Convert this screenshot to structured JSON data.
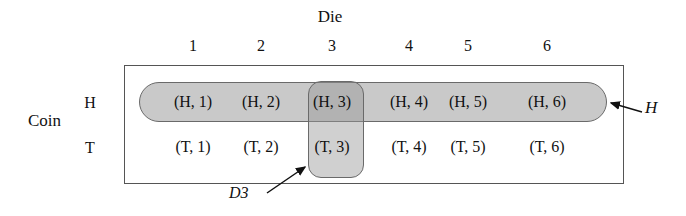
{
  "figure": {
    "title_top": "Die",
    "title_side": "Coin",
    "column_headers": [
      "1",
      "2",
      "3",
      "4",
      "5",
      "6"
    ],
    "row_headers": [
      "H",
      "T"
    ],
    "cells": {
      "row_h": [
        "(H, 1)",
        "(H, 2)",
        "(H, 3)",
        "(H, 4)",
        "(H, 5)",
        "(H, 6)"
      ],
      "row_t": [
        "(T, 1)",
        "(T, 2)",
        "(T, 3)",
        "(T, 4)",
        "(T, 5)",
        "(T, 6)"
      ]
    },
    "annotations": {
      "event_h_label": "H",
      "event_d3_label": "D3"
    },
    "colors": {
      "event_h_fill": "#c9c9c9",
      "event_d3_fill": "#c0c0c0",
      "intersection_fill": "#a0a0a0",
      "shape_stroke": "#6a6a6a",
      "rect_stroke": "#555555",
      "text": "#111111",
      "background": "#ffffff"
    }
  }
}
